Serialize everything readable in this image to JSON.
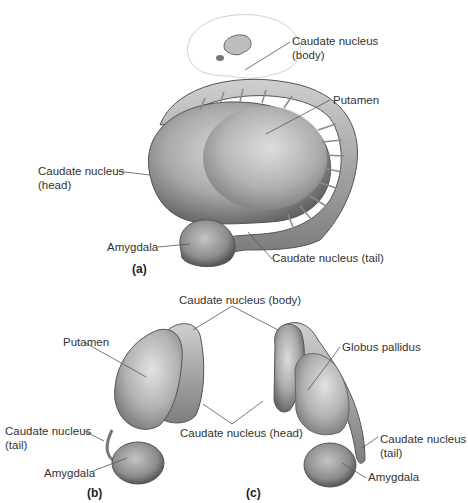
{
  "figure": {
    "colors": {
      "tissue_light": "#d4d4d4",
      "tissue_mid": "#a8a8a8",
      "tissue_dark": "#6f6f6f",
      "leader_line": "#555555",
      "text": "#333333"
    }
  },
  "panel_a": {
    "tag": "(a)",
    "labels": {
      "caudate_body_line1": "Caudate nucleus",
      "caudate_body_line2": "(body)",
      "putamen": "Putamen",
      "caudate_head_line1": "Caudate nucleus",
      "caudate_head_line2": "(head)",
      "amygdala": "Amygdala",
      "caudate_tail": "Caudate nucleus (tail)"
    },
    "inset": "brain-outline-thumbnail"
  },
  "shared_labels": {
    "caudate_body": "Caudate nucleus (body)",
    "caudate_head": "Caudate nucleus (head)"
  },
  "panel_b": {
    "tag": "(b)",
    "labels": {
      "putamen": "Putamen",
      "caudate_tail_line1": "Caudate nucleus",
      "caudate_tail_line2": "(tail)",
      "amygdala": "Amygdala"
    }
  },
  "panel_c": {
    "tag": "(c)",
    "labels": {
      "globus_pallidus": "Globus pallidus",
      "caudate_tail_line1": "Caudate nucleus",
      "caudate_tail_line2": "(tail)",
      "amygdala": "Amygdala"
    }
  }
}
